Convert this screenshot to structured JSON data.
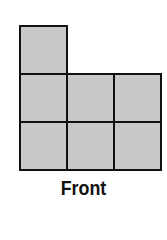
{
  "diagram": {
    "title": "Front",
    "cell_fill": "#c8c8c8",
    "border_color": "#111111",
    "cells": [
      {
        "row": 0,
        "col": 0
      },
      {
        "row": 1,
        "col": 0
      },
      {
        "row": 1,
        "col": 1
      },
      {
        "row": 1,
        "col": 2
      },
      {
        "row": 2,
        "col": 0
      },
      {
        "row": 2,
        "col": 1
      },
      {
        "row": 2,
        "col": 2
      }
    ]
  }
}
